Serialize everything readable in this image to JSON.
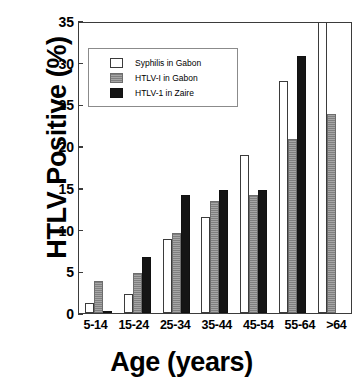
{
  "chart_data": {
    "type": "bar",
    "title": "",
    "xlabel": "Age (years)",
    "ylabel": "HTLV Positive (%)",
    "categories": [
      "5-14",
      "15-24",
      "25-34",
      "35-44",
      "45-54",
      "55-64",
      ">64"
    ],
    "series": [
      {
        "name": "Syphilis in Gabon",
        "color": "#ffffff",
        "values": [
          1.2,
          2.3,
          8.9,
          11.5,
          19.0,
          27.8,
          35.0
        ],
        "clipped": [
          false,
          false,
          false,
          false,
          false,
          false,
          true
        ]
      },
      {
        "name": "HTLV-I in Gabon",
        "color": "#8d8d8d",
        "values": [
          3.8,
          4.8,
          9.6,
          13.4,
          14.2,
          20.8,
          23.8
        ],
        "clipped": [
          false,
          false,
          false,
          false,
          false,
          false,
          false
        ]
      },
      {
        "name": "HTLV-1 in Zaire",
        "color": "#151515",
        "values": [
          0.3,
          6.7,
          14.1,
          14.7,
          14.7,
          30.8,
          null
        ],
        "clipped": [
          false,
          false,
          false,
          false,
          false,
          false,
          false
        ]
      }
    ],
    "ylim": [
      0,
      35
    ],
    "yticks": [
      0,
      5,
      10,
      15,
      20,
      25,
      30,
      35
    ],
    "grid": false,
    "legend_position": "upper-left-inside"
  }
}
